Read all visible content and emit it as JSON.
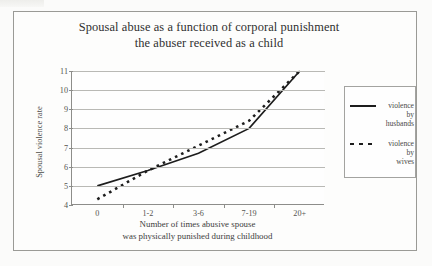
{
  "chart_data": {
    "type": "line",
    "title": "Spousal abuse as a function of corporal punishment the abuser received as a child",
    "title_line1": "Spousal abuse as a function of corporal punishment",
    "title_line2": "the abuser received as a child",
    "xlabel": "Number of times abusive spouse was physically punished during childhood",
    "xlabel_line1": "Number of times abusive spouse",
    "xlabel_line2": "was physically punished during childhood",
    "ylabel": "Spousal violence rate",
    "categories": [
      "0",
      "1-2",
      "3-6",
      "7-19",
      "20+"
    ],
    "ylim": [
      4,
      11
    ],
    "yticks": [
      "11",
      "10",
      "9",
      "8",
      "7",
      "6",
      "5",
      "4"
    ],
    "grid": true,
    "legend_position": "right",
    "series": [
      {
        "name": "violence by husbands",
        "name_lines": [
          "violence",
          "by",
          "husbands"
        ],
        "style": "solid",
        "color": "#1d1d1d",
        "values": [
          5.0,
          5.8,
          6.7,
          8.0,
          11.0
        ]
      },
      {
        "name": "violence by wives",
        "name_lines": [
          "violence",
          "by",
          "wives"
        ],
        "style": "dotted",
        "color": "#1d1d1d",
        "values": [
          4.3,
          5.8,
          7.1,
          8.4,
          11.0
        ]
      }
    ]
  }
}
